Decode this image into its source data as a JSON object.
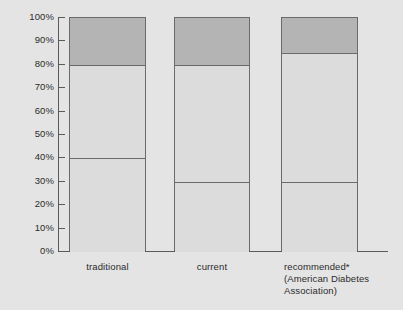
{
  "chart_data": {
    "type": "bar",
    "subtype": "stacked-bar-100-percent",
    "title": "",
    "xlabel": "",
    "ylabel": "",
    "ylim": [
      0,
      100
    ],
    "y_tick_labels": [
      "100%",
      "90%",
      "80%",
      "70%",
      "60%",
      "50%",
      "40%",
      "30%",
      "20%",
      "10%",
      "0%"
    ],
    "y_tick_values": [
      100,
      90,
      80,
      70,
      60,
      50,
      40,
      30,
      20,
      10,
      0
    ],
    "grid": false,
    "legend": "none",
    "categories": [
      "traditional",
      "current",
      "recommended*"
    ],
    "category_sublabels": [
      "",
      "",
      "(American Diabetes Association)"
    ],
    "series": [
      {
        "name": "bottom-segment",
        "values": [
          40,
          30,
          30
        ],
        "color": "#dcdcdc"
      },
      {
        "name": "middle-segment",
        "values": [
          40,
          50,
          55
        ],
        "color": "#dcdcdc"
      },
      {
        "name": "top-segment",
        "values": [
          20,
          20,
          15
        ],
        "color": "#b4b4b4"
      }
    ],
    "cumulative_boundaries": [
      [
        40,
        80
      ],
      [
        30,
        80
      ],
      [
        30,
        85
      ]
    ],
    "footnote_marker": "*",
    "background_color": "#e4e4e4",
    "axis_color": "#5a5a5a",
    "bar_outline_color": "#6a6a6a"
  },
  "axis": {
    "ticks": [
      {
        "label": "100%",
        "value": 100
      },
      {
        "label": "90%",
        "value": 90
      },
      {
        "label": "80%",
        "value": 80
      },
      {
        "label": "70%",
        "value": 70
      },
      {
        "label": "60%",
        "value": 60
      },
      {
        "label": "50%",
        "value": 50
      },
      {
        "label": "40%",
        "value": 40
      },
      {
        "label": "30%",
        "value": 30
      },
      {
        "label": "20%",
        "value": 20
      },
      {
        "label": "10%",
        "value": 10
      },
      {
        "label": "0%",
        "value": 0
      }
    ]
  },
  "categories": [
    {
      "label": "traditional",
      "sub1": "",
      "sub2": ""
    },
    {
      "label": "current",
      "sub1": "",
      "sub2": ""
    },
    {
      "label": "recommended*",
      "sub1": "(American Diabetes",
      "sub2": "Association)"
    }
  ]
}
